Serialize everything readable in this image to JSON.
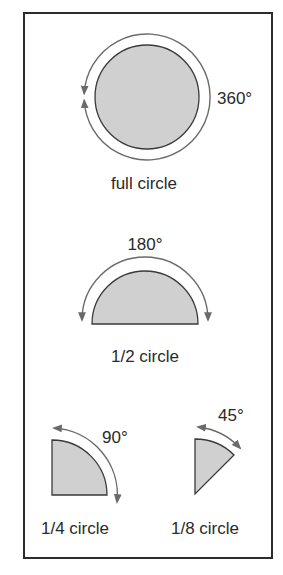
{
  "colors": {
    "frame": "#2b2b2b",
    "shape_fill": "#d0d0d0",
    "shape_stroke": "#3a3a3a",
    "arc_stroke": "#6a6a6a",
    "text": "#2a2a2a"
  },
  "figures": [
    {
      "id": "full",
      "name": "full circle",
      "degrees": "360°",
      "caption": "full circle"
    },
    {
      "id": "half",
      "name": "1/2 circle",
      "degrees": "180°",
      "caption": "1/2 circle"
    },
    {
      "id": "quarter",
      "name": "1/4 circle",
      "degrees": "90°",
      "caption": "1/4 circle"
    },
    {
      "id": "eighth",
      "name": "1/8 circle",
      "degrees": "45°",
      "caption": "1/8 circle"
    }
  ]
}
